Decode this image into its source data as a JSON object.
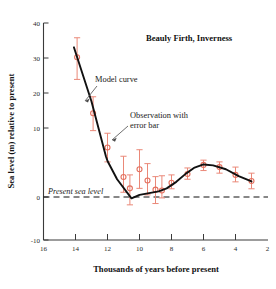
{
  "chart_data": {
    "type": "scatter",
    "title": "Beauly Firth, Inverness",
    "xlabel": "Thousands of years before present",
    "ylabel": "Sea level (m) relative to present",
    "xlim": [
      16,
      2
    ],
    "ylim": [
      -10,
      40
    ],
    "x_ticks": [
      16,
      14,
      12,
      10,
      8,
      6,
      4,
      2
    ],
    "x_tick_labels": [
      "16",
      "14",
      "12",
      "10",
      "8",
      "6",
      "4",
      "2"
    ],
    "y_ticks": [
      -10,
      0,
      10,
      20,
      30,
      40
    ],
    "y_tick_labels": [
      "-10",
      "0",
      "10",
      "20",
      "30",
      "40"
    ],
    "x_axis_inverted": true,
    "grid": false,
    "legend": "none",
    "series": [
      {
        "name": "Observation with error bar",
        "type": "scatter",
        "marker": "open-circle",
        "color": "#e4705e",
        "points": [
          {
            "x": 13.9,
            "y": 32.1,
            "yerr_low": 27.0,
            "yerr_high": 36.6
          },
          {
            "x": 12.9,
            "y": 19.2,
            "yerr_low": 15.2,
            "yerr_high": 23.0
          },
          {
            "x": 12.0,
            "y": 11.3,
            "yerr_low": 8.0,
            "yerr_high": 14.6
          },
          {
            "x": 11.0,
            "y": 4.5,
            "yerr_low": 1.0,
            "yerr_high": 9.3
          },
          {
            "x": 10.6,
            "y": 1.9,
            "yerr_low": -1.9,
            "yerr_high": 5.0
          },
          {
            "x": 10.0,
            "y": 6.3,
            "yerr_low": 1.9,
            "yerr_high": 10.8
          },
          {
            "x": 9.5,
            "y": 3.7,
            "yerr_low": 0.4,
            "yerr_high": 7.6
          },
          {
            "x": 9.0,
            "y": 1.6,
            "yerr_low": -1.6,
            "yerr_high": 4.6
          },
          {
            "x": 8.6,
            "y": 1.4,
            "yerr_low": -0.3,
            "yerr_high": 4.8
          },
          {
            "x": 8.0,
            "y": 3.2,
            "yerr_low": 1.8,
            "yerr_high": 5.0
          },
          {
            "x": 7.0,
            "y": 5.2,
            "yerr_low": 4.0,
            "yerr_high": 6.6
          },
          {
            "x": 6.0,
            "y": 7.3,
            "yerr_low": 6.0,
            "yerr_high": 8.4
          },
          {
            "x": 5.0,
            "y": 6.8,
            "yerr_low": 5.4,
            "yerr_high": 8.0
          },
          {
            "x": 4.0,
            "y": 5.0,
            "yerr_low": 3.4,
            "yerr_high": 6.8
          },
          {
            "x": 3.0,
            "y": 3.6,
            "yerr_low": 1.8,
            "yerr_high": 5.4
          }
        ]
      },
      {
        "name": "Model curve",
        "type": "line",
        "color": "#111111",
        "x": [
          14.1,
          13.0,
          12.1,
          12.0,
          11.4,
          10.5,
          10.0,
          9.4,
          8.8,
          8.3,
          7.7,
          7.1,
          6.6,
          6.0,
          5.4,
          4.6,
          3.8,
          3.0
        ],
        "y": [
          34.4,
          21.9,
          9.3,
          8.2,
          4.0,
          -0.4,
          0.4,
          0.8,
          1.2,
          1.9,
          3.4,
          5.3,
          6.6,
          7.4,
          7.2,
          6.3,
          4.7,
          3.5
        ]
      }
    ],
    "reference_line": {
      "label": "Present sea level",
      "y": 0,
      "style": "dashed",
      "color": "#111111"
    },
    "annotations": [
      {
        "text": "Model curve",
        "target_x": 12.6,
        "target_y": 18.0
      },
      {
        "text": "Observation with",
        "text2": "error bar",
        "target_x": 12.0,
        "target_y": 11.3
      }
    ]
  },
  "figure": {
    "title": "Beauly Firth, Inverness",
    "y_axis_title": "Sea level (m) relative to present",
    "x_axis_title": "Thousands of years before present",
    "present_sea_level_label": "Present sea level",
    "annotation_model": "Model curve",
    "annotation_obs_line1": "Observation with",
    "annotation_obs_line2": "error bar",
    "y_labels": {
      "t40": "40",
      "t30": "30",
      "t20": "20",
      "t10": "10",
      "t0": "0",
      "tm10": "-10"
    },
    "x_labels": {
      "t16": "16",
      "t14": "14",
      "t12": "12",
      "t10": "10",
      "t8": "8",
      "t6": "6",
      "t4": "4",
      "t2": "2"
    },
    "colors": {
      "marker": "#e4705e",
      "errorbar": "#ea8878",
      "curve": "#111111",
      "axis": "#3a3a3a"
    }
  }
}
